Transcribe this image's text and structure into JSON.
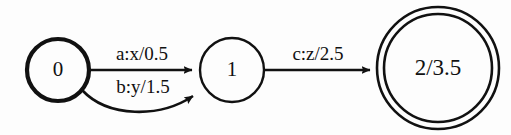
{
  "diagram": {
    "type": "finite-state-transducer",
    "background_color": "#fdfdfd",
    "ink_color": "#111111",
    "states": [
      {
        "id": "s0",
        "label": "0",
        "role": "start",
        "shape": "circle",
        "double": false,
        "cx": 58,
        "cy": 70,
        "r": 31,
        "stroke_width": 4.2,
        "font_size": 21
      },
      {
        "id": "s1",
        "label": "1",
        "role": "intermediate",
        "shape": "circle",
        "double": false,
        "cx": 232,
        "cy": 70,
        "r": 32,
        "stroke_width": 2.4,
        "font_size": 21
      },
      {
        "id": "s2",
        "label": "2/3.5",
        "role": "final",
        "shape": "double-circle",
        "double": true,
        "cx": 438,
        "cy": 68,
        "r": 61,
        "r_inner": 54,
        "stroke_width": 2.6,
        "font_size": 23
      }
    ],
    "transitions": [
      {
        "id": "t0",
        "from": "0",
        "to": "1",
        "label": "a:x/0.5",
        "input": "a",
        "output": "x",
        "weight": "0.5",
        "style": "straight",
        "label_x": 142,
        "label_y": 60,
        "font_size": 19
      },
      {
        "id": "t1",
        "from": "0",
        "to": "1",
        "label": "b:y/1.5",
        "input": "b",
        "output": "y",
        "weight": "1.5",
        "style": "curved",
        "label_x": 143,
        "label_y": 93,
        "font_size": 19
      },
      {
        "id": "t2",
        "from": "1",
        "to": "2",
        "label": "c:z/2.5",
        "input": "c",
        "output": "z",
        "weight": "2.5",
        "style": "straight",
        "label_x": 318,
        "label_y": 60,
        "font_size": 19
      }
    ]
  }
}
